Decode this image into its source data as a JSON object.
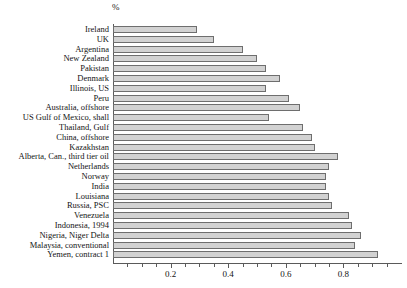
{
  "chart_data": {
    "type": "bar",
    "orientation": "horizontal",
    "title": "",
    "subtitle": "",
    "unit_label": "%",
    "xlabel": "",
    "ylabel": "",
    "xlim": [
      0,
      1.0
    ],
    "grid": false,
    "legend": null,
    "categories": [
      "Ireland",
      "UK",
      "Argentina",
      "New Zealand",
      "Pakistan",
      "Denmark",
      "Illinois, US",
      "Peru",
      "Australia, offshore",
      "US Gulf of Mexico, shall",
      "Thailand, Gulf",
      "China, offshore",
      "Kazakhstan",
      "Alberta, Can., third tier oil",
      "Netherlands",
      "Norway",
      "India",
      "Louisiana",
      "Russia, PSC",
      "Venezuela",
      "Indonesia, 1994",
      "Nigeria, Niger Delta",
      "Malaysia, conventional",
      "Yemen, contract 1"
    ],
    "values": [
      0.29,
      0.35,
      0.45,
      0.5,
      0.53,
      0.58,
      0.53,
      0.61,
      0.65,
      0.54,
      0.66,
      0.69,
      0.7,
      0.78,
      0.75,
      0.74,
      0.74,
      0.75,
      0.76,
      0.82,
      0.83,
      0.86,
      0.84,
      0.92
    ],
    "xticks_major": [
      0.2,
      0.4,
      0.6,
      0.8
    ],
    "xtick_labels": [
      "0.2",
      "0.4",
      "0.6",
      "0.8"
    ],
    "xticks_minor": [
      0.05,
      0.1,
      0.15,
      0.25,
      0.3,
      0.35,
      0.45,
      0.5,
      0.55,
      0.65,
      0.7,
      0.75,
      0.85,
      0.9,
      0.95
    ],
    "colors": {
      "bar_fill": "#d2d2d2",
      "bar_edge": "#6e6e6e",
      "axis": "#5a5a5a",
      "text": "#141414",
      "background": "#ffffff"
    }
  }
}
